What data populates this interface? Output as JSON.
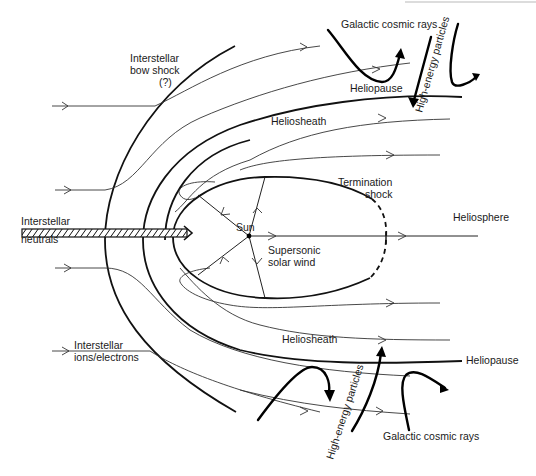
{
  "diagram": {
    "labels": {
      "bow_shock_1": "Interstellar",
      "bow_shock_2": "bow shock",
      "bow_shock_3": "(?)",
      "gcr_top": "Galactic cosmic rays",
      "hep_top": "High-energy particles",
      "heliopause_top": "Heliopause",
      "heliosheath_top": "Heliosheath",
      "termination_1": "Termination",
      "termination_2": "shock",
      "heliosphere": "Heliosphere",
      "neutrals_1": "Interstellar",
      "neutrals_2": "neutrals",
      "sun": "Sun",
      "solar_wind_1": "Supersonic",
      "solar_wind_2": "solar wind",
      "ions_1": "Interstellar",
      "ions_2": "ions/electrons",
      "heliosheath_bottom": "Heliosheath",
      "heliopause_bottom": "Heliopause",
      "hep_bottom": "High-energy particles",
      "gcr_bottom": "Galactic cosmic rays"
    },
    "colors": {
      "ink": "#111111",
      "background": "#ffffff"
    }
  }
}
